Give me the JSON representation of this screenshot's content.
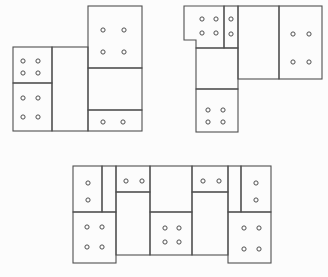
{
  "canvas": {
    "width": 328,
    "height": 277,
    "background": "#fcfcfc"
  },
  "style": {
    "line_color": "#4f4f4f",
    "line_width": 1.1,
    "cell_fill": "none",
    "pip_radius": 2.1,
    "pip_fill": "#fdfdfd",
    "pip_line_width": 1
  },
  "figures": [
    {
      "id": "domino-figure-top-left",
      "cells": [
        {
          "x": 13,
          "y": 47,
          "w": 39,
          "h": 36,
          "pips": [
            [
              23,
              61
            ],
            [
              38,
              61
            ],
            [
              23,
              73
            ],
            [
              38,
              73
            ]
          ]
        },
        {
          "x": 13,
          "y": 83,
          "w": 39,
          "h": 48,
          "pips": [
            [
              23,
              98
            ],
            [
              38,
              98
            ],
            [
              23,
              117
            ],
            [
              38,
              117
            ]
          ]
        },
        {
          "x": 52,
          "y": 47,
          "w": 36,
          "h": 84,
          "pips": []
        },
        {
          "x": 88,
          "y": 6,
          "w": 54,
          "h": 62,
          "pips": [
            [
              103,
              30
            ],
            [
              124,
              30
            ],
            [
              103,
              52
            ],
            [
              124,
              52
            ]
          ]
        },
        {
          "x": 88,
          "y": 68,
          "w": 54,
          "h": 42,
          "pips": []
        },
        {
          "x": 88,
          "y": 110,
          "w": 54,
          "h": 21,
          "pips": [
            [
              103,
              122
            ],
            [
              123,
              122
            ]
          ]
        }
      ]
    },
    {
      "id": "domino-figure-top-right",
      "cells": [
        {
          "points": [
            [
              184,
              6
            ],
            [
              224,
              6
            ],
            [
              224,
              48
            ],
            [
              196,
              48
            ],
            [
              196,
              40
            ],
            [
              184,
              40
            ]
          ],
          "pips": [
            [
              202,
              19
            ],
            [
              216,
              19
            ],
            [
              202,
              33
            ],
            [
              216,
              33
            ]
          ]
        },
        {
          "x": 224,
          "y": 6,
          "w": 14,
          "h": 42,
          "pips": [
            [
              231,
              19
            ],
            [
              231,
              34
            ]
          ]
        },
        {
          "x": 238,
          "y": 6,
          "w": 41,
          "h": 73,
          "pips": []
        },
        {
          "x": 279,
          "y": 6,
          "w": 43,
          "h": 73,
          "pips": [
            [
              293,
              34
            ],
            [
              309,
              34
            ],
            [
              293,
              62
            ],
            [
              309,
              62
            ]
          ]
        },
        {
          "x": 196,
          "y": 48,
          "w": 42,
          "h": 41,
          "pips": []
        },
        {
          "x": 196,
          "y": 89,
          "w": 42,
          "h": 43,
          "pips": [
            [
              208,
              110
            ],
            [
              223,
              110
            ],
            [
              208,
              122
            ],
            [
              223,
              122
            ]
          ]
        }
      ]
    },
    {
      "id": "domino-figure-bottom",
      "cells": [
        {
          "x": 73,
          "y": 166,
          "w": 29,
          "h": 46,
          "pips": [
            [
              88,
              183
            ],
            [
              88,
              200
            ]
          ]
        },
        {
          "x": 102,
          "y": 166,
          "w": 14,
          "h": 46,
          "pips": []
        },
        {
          "x": 116,
          "y": 166,
          "w": 34,
          "h": 26,
          "pips": [
            [
              126,
              181
            ],
            [
              142,
              181
            ]
          ]
        },
        {
          "x": 116,
          "y": 192,
          "w": 34,
          "h": 63,
          "pips": []
        },
        {
          "x": 150,
          "y": 166,
          "w": 42,
          "h": 46,
          "pips": []
        },
        {
          "x": 150,
          "y": 212,
          "w": 42,
          "h": 43,
          "pips": [
            [
              165,
              228
            ],
            [
              179,
              228
            ],
            [
              165,
              242
            ],
            [
              179,
              242
            ]
          ]
        },
        {
          "x": 192,
          "y": 166,
          "w": 36,
          "h": 26,
          "pips": [
            [
              203,
              181
            ],
            [
              219,
              181
            ]
          ]
        },
        {
          "x": 192,
          "y": 192,
          "w": 36,
          "h": 63,
          "pips": []
        },
        {
          "x": 228,
          "y": 166,
          "w": 13,
          "h": 46,
          "pips": []
        },
        {
          "x": 241,
          "y": 166,
          "w": 30,
          "h": 46,
          "pips": [
            [
              256,
              183
            ],
            [
              256,
              200
            ]
          ]
        },
        {
          "x": 73,
          "y": 212,
          "w": 43,
          "h": 51,
          "pips": [
            [
              87,
              227
            ],
            [
              102,
              227
            ],
            [
              87,
              247
            ],
            [
              102,
              247
            ]
          ]
        },
        {
          "x": 228,
          "y": 212,
          "w": 43,
          "h": 51,
          "pips": [
            [
              244,
              228
            ],
            [
              259,
              228
            ],
            [
              244,
              249
            ],
            [
              259,
              249
            ]
          ]
        }
      ]
    }
  ]
}
